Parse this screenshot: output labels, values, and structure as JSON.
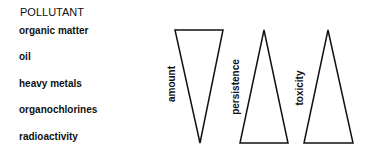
{
  "title": "POLLUTANT",
  "pollutants": [
    "organic matter",
    "oil",
    "heavy metals",
    "organochlorines",
    "radioactivity"
  ],
  "indicators": [
    {
      "label": "amount",
      "direction": "decreasing"
    },
    {
      "label": "persistence",
      "direction": "increasing"
    },
    {
      "label": "toxicity",
      "direction": "increasing"
    }
  ]
}
